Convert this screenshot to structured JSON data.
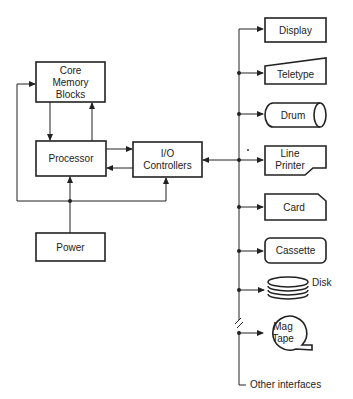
{
  "diagram": {
    "type": "computer system block diagram",
    "colors": {
      "line": "#222222",
      "background": "#ffffff"
    },
    "blocks": {
      "core_memory": {
        "lines": [
          "Core",
          "Memory",
          "Blocks"
        ]
      },
      "processor": {
        "label": "Processor"
      },
      "io_controllers": {
        "lines": [
          "I/O",
          "Controllers"
        ]
      },
      "power": {
        "label": "Power"
      }
    },
    "peripherals": [
      {
        "id": "display",
        "label": "Display",
        "shape": "rectangle"
      },
      {
        "id": "teletype",
        "label": "Teletype",
        "shape": "slanted-top"
      },
      {
        "id": "drum",
        "label": "Drum",
        "shape": "cylinder"
      },
      {
        "id": "line-printer",
        "lines": [
          "Line",
          "Printer"
        ],
        "shape": "torn-corner"
      },
      {
        "id": "card",
        "label": "Card",
        "shape": "clipped-corner"
      },
      {
        "id": "cassette",
        "label": "Cassette",
        "shape": "rounded-rectangle"
      },
      {
        "id": "disk",
        "label": "Disk",
        "shape": "stacked-platters"
      },
      {
        "id": "mag-tape",
        "lines": [
          "Mag",
          "Tape"
        ],
        "shape": "reel"
      }
    ],
    "other_interfaces": "Other interfaces",
    "edges": [
      {
        "from": "core_memory",
        "to": "processor"
      },
      {
        "from": "processor",
        "to": "core_memory"
      },
      {
        "from": "processor",
        "to": "io_controllers"
      },
      {
        "from": "io_controllers",
        "to": "processor"
      },
      {
        "from": "power",
        "to": "processor"
      },
      {
        "from": "power",
        "to": "io_controllers"
      },
      {
        "from": "power",
        "to": "core_memory"
      },
      {
        "from": "io_controllers",
        "to": "peripheral_bus",
        "bidirectional": true
      }
    ]
  }
}
